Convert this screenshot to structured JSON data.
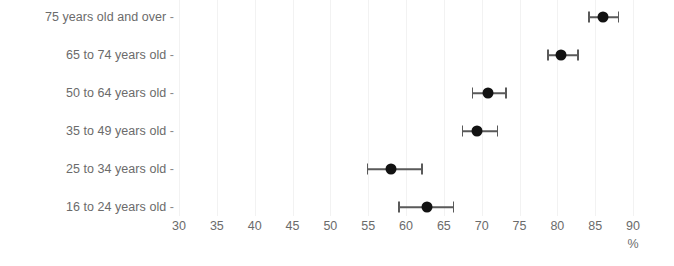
{
  "chart_data": {
    "type": "scatter",
    "title": "",
    "subtitle": "",
    "xlabel": "%",
    "ylabel": "",
    "orientation": "horizontal",
    "grid": true,
    "legend": false,
    "xlim": [
      30,
      90
    ],
    "xticks": [
      30,
      35,
      40,
      45,
      50,
      55,
      60,
      65,
      70,
      75,
      80,
      85,
      90
    ],
    "xtick_labels": [
      "30",
      "35",
      "40",
      "45",
      "50",
      "55",
      "60",
      "65",
      "70",
      "75",
      "80",
      "85",
      "90"
    ],
    "unit_label": "%",
    "categories": [
      "75 years old and over",
      "65 to 74 years old",
      "50 to 64 years old",
      "35 to 49 years old",
      "25 to 34 years old",
      "16 to 24 years old"
    ],
    "values": [
      86.0,
      80.5,
      70.9,
      69.4,
      58.0,
      62.8
    ],
    "ci_low": [
      84.1,
      78.7,
      68.7,
      67.4,
      54.8,
      59.0
    ],
    "ci_high": [
      88.0,
      82.6,
      73.1,
      72.0,
      62.0,
      66.2
    ],
    "points": [
      {
        "category": "75 years old and over",
        "value": 86.0,
        "ci_low": 84.1,
        "ci_high": 88.0
      },
      {
        "category": "65 to 74 years old",
        "value": 80.5,
        "ci_low": 78.7,
        "ci_high": 82.6
      },
      {
        "category": "50 to 64 years old",
        "value": 70.9,
        "ci_low": 68.7,
        "ci_high": 73.1
      },
      {
        "category": "35 to 49 years old",
        "value": 69.4,
        "ci_low": 67.4,
        "ci_high": 72.0
      },
      {
        "category": "25 to 34 years old",
        "value": 58.0,
        "ci_low": 54.8,
        "ci_high": 62.0
      },
      {
        "category": "16 to 24 years old",
        "value": 62.8,
        "ci_low": 59.0,
        "ci_high": 66.2
      }
    ],
    "colors": {
      "point": "#121212",
      "error_bar": "#5a5a5a",
      "gridline": "#f2f2f2",
      "tick_text": "#6b6b6b",
      "background": "#ffffff"
    }
  },
  "axis": {
    "ytick_dash": "-"
  }
}
